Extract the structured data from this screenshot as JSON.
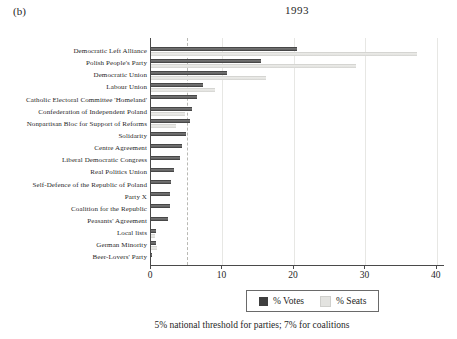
{
  "panel_label": "(b)",
  "title": "1993",
  "caption": "5% national threshold for parties; 7% for coalitions",
  "legend": {
    "votes_label": "% Votes",
    "seats_label": "% Seats"
  },
  "colors": {
    "votes_bar": "#3f3f3f",
    "seats_bar": "#e3e3e0",
    "axis": "#4a4a4a",
    "gridline": "#e7e7e4",
    "threshold_line": "#b9b9b4",
    "background": "#ffffff"
  },
  "chart_data": {
    "type": "bar",
    "orientation": "horizontal",
    "title": "1993",
    "xlabel": "",
    "ylabel": "",
    "xlim": [
      0,
      41
    ],
    "x_ticks": [
      0,
      10,
      20,
      30,
      40
    ],
    "grid": true,
    "threshold_x": 5,
    "legend_position": "bottom",
    "annotation": "5% national threshold for parties; 7% for coalitions",
    "categories": [
      "Democratic Left Alliance",
      "Polish People's Party",
      "Democratic Union",
      "Labour Union",
      "Catholic Electoral Committee 'Homeland'",
      "Confederation of Independent Poland",
      "Nonpartisan Bloc for Support of Reforms",
      "Solidarity",
      "Centre Agreement",
      "Liberal Democratic Congress",
      "Real Politics Union",
      "Self-Defence of the Republic of Poland",
      "Party X",
      "Coalition for the Republic",
      "Peasants' Agreement",
      "Local lists",
      "German Minority",
      "Beer-Lovers' Party"
    ],
    "series": [
      {
        "name": "% Votes",
        "values": [
          20.4,
          15.4,
          10.6,
          7.3,
          6.4,
          5.8,
          5.4,
          4.9,
          4.4,
          4.0,
          3.2,
          2.8,
          2.7,
          2.7,
          2.4,
          0.7,
          0.7,
          0.1
        ]
      },
      {
        "name": "% Seats",
        "values": [
          37.2,
          28.7,
          16.1,
          8.9,
          0,
          4.8,
          3.5,
          0,
          0,
          0,
          0,
          0,
          0,
          0,
          0,
          0.5,
          0.9,
          0
        ]
      }
    ]
  }
}
